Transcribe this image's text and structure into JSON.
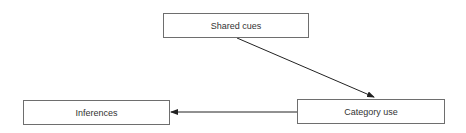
{
  "diagram": {
    "nodes": [
      {
        "id": "shared-cues",
        "label": "Shared cues"
      },
      {
        "id": "inferences",
        "label": "Inferences"
      },
      {
        "id": "category-use",
        "label": "Category use"
      }
    ],
    "edges": [
      {
        "from": "shared-cues",
        "to": "category-use"
      },
      {
        "from": "category-use",
        "to": "inferences"
      }
    ]
  }
}
